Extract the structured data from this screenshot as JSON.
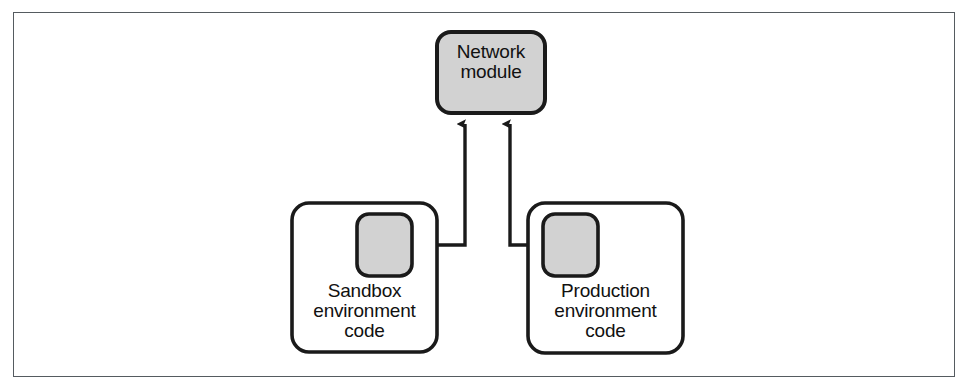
{
  "figure": {
    "background_color": "#ffffff",
    "frame_color": "#555b60"
  },
  "colors": {
    "shape_fill_gray": "#d2d2d2",
    "shape_fill_white": "#ffffff",
    "stroke": "#1a1a1a",
    "text": "#111111"
  },
  "nodes": [
    {
      "id": "network-module",
      "label": "Network\nmodule",
      "shape": "rounded-rectangle",
      "fill": "#d2d2d2",
      "x": 437,
      "y": 32,
      "width": 108,
      "height": 81
    },
    {
      "id": "sandbox-environment-code",
      "label": "Sandbox\nenvironment\ncode",
      "shape": "rounded-rectangle",
      "fill": "#ffffff",
      "x": 292,
      "y": 203,
      "width": 145,
      "height": 149
    },
    {
      "id": "production-environment-code",
      "label": "Production\nenvironment\ncode",
      "shape": "rounded-rectangle",
      "fill": "#ffffff",
      "x": 528,
      "y": 203,
      "width": 155,
      "height": 150
    },
    {
      "id": "sandbox-module-slot",
      "label": "",
      "shape": "rounded-square",
      "fill": "#d2d2d2",
      "x": 357,
      "y": 214,
      "width": 55,
      "height": 62
    },
    {
      "id": "production-module-slot",
      "label": "",
      "shape": "rounded-square",
      "fill": "#d2d2d2",
      "x": 543,
      "y": 214,
      "width": 55,
      "height": 62
    }
  ],
  "connectors": [
    {
      "id": "sandbox-to-network",
      "from": "sandbox-module-slot",
      "to": "network-module",
      "style": "elbow",
      "arrowhead": "filled-triangle",
      "path": "M 412 245 L 465 245 L 465 122"
    },
    {
      "id": "production-to-network",
      "from": "production-module-slot",
      "to": "network-module",
      "style": "elbow",
      "arrowhead": "filled-triangle",
      "path": "M 543 245 L 510 245 L 510 122"
    }
  ]
}
